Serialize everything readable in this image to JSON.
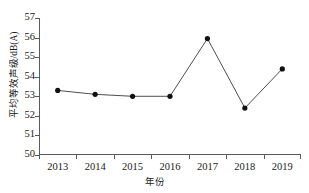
{
  "chart_data": {
    "type": "line",
    "title": "",
    "xlabel": "年份",
    "ylabel": "平均等效声级/dB(A)",
    "categories": [
      "2013",
      "2014",
      "2015",
      "2016",
      "2017",
      "2018",
      "2019"
    ],
    "values": [
      53.3,
      53.1,
      53.0,
      53.0,
      55.95,
      52.4,
      54.4
    ],
    "series": [
      {
        "name": "平均等效声级",
        "values": [
          53.3,
          53.1,
          53.0,
          53.0,
          55.95,
          52.4,
          54.4
        ]
      }
    ],
    "ylim": [
      50,
      57
    ],
    "yticks": [
      "50",
      "51",
      "52",
      "53",
      "54",
      "55",
      "56",
      "57"
    ],
    "xticks": [
      "2013",
      "2014",
      "2015",
      "2016",
      "2017",
      "2018",
      "2019"
    ],
    "grid": false,
    "legend": "none",
    "line_color": "#3a3a3a",
    "marker_color": "#111111",
    "marker": "circle",
    "axis_color": "#5a5a5a",
    "background": "#ffffff"
  }
}
